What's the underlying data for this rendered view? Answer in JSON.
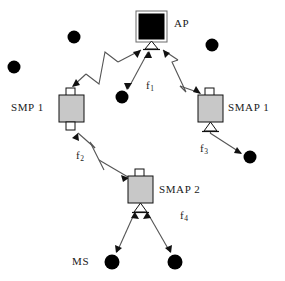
{
  "diagram": {
    "colors": {
      "ap_fill": "#000000",
      "node_fill": "#c8c8c8",
      "node_stroke": "#1a1a1a",
      "stub_fill": "#ffffff",
      "dot_fill": "#000000",
      "line": "#555555",
      "background": "#ffffff"
    },
    "nodes": [
      {
        "id": "ap",
        "label": "AP",
        "type": "access-point",
        "x": 151.5,
        "y": 26.5,
        "box": {
          "x": 137,
          "y": 12,
          "w": 29,
          "h": 29
        },
        "label_x": 174,
        "label_y": 18
      },
      {
        "id": "smp1",
        "label": "SMP  1",
        "type": "smp-relay",
        "x": 71.5,
        "y": 108.5,
        "box": {
          "x": 59,
          "y": 95,
          "w": 25,
          "h": 27
        },
        "label_x": 11,
        "label_y": 102
      },
      {
        "id": "smap1",
        "label": "SMAP  1",
        "type": "smap-relay",
        "x": 210.5,
        "y": 108.5,
        "box": {
          "x": 198,
          "y": 95,
          "w": 25,
          "h": 27
        },
        "label_x": 228,
        "label_y": 102
      },
      {
        "id": "smap2",
        "label": "SMAP  2",
        "type": "smap-relay",
        "x": 140.5,
        "y": 189.5,
        "box": {
          "x": 128,
          "y": 176,
          "w": 25,
          "h": 27
        },
        "label_x": 159,
        "label_y": 184
      }
    ],
    "stations": [
      {
        "id": "ms-a",
        "x": 14,
        "y": 67,
        "r": 6.5
      },
      {
        "id": "ms-b",
        "x": 74,
        "y": 37,
        "r": 6.5
      },
      {
        "id": "ms-c",
        "x": 122,
        "y": 97,
        "r": 6.5
      },
      {
        "id": "ms-d",
        "x": 212,
        "y": 45,
        "r": 6.5
      },
      {
        "id": "ms-e",
        "x": 250,
        "y": 157,
        "r": 6.5
      },
      {
        "id": "ms-f",
        "x": 112,
        "y": 262,
        "r": 7.5
      },
      {
        "id": "ms-g",
        "x": 175,
        "y": 262,
        "r": 7.5
      }
    ],
    "station_group_label": {
      "text": "MS",
      "x": 72,
      "y": 256
    },
    "links": [
      {
        "id": "link-ap-smp1",
        "from": "ap",
        "to": "smp1",
        "kind": "zigzag",
        "arrows": "both"
      },
      {
        "id": "link-ap-smap1",
        "from": "ap",
        "to": "smap1",
        "kind": "zigzag",
        "arrows": "both"
      },
      {
        "id": "link-ms-c-ap",
        "from": "ms-c",
        "to": "ap",
        "kind": "straight",
        "arrows": "both"
      },
      {
        "id": "link-smp1-smap2",
        "from": "smp1",
        "to": "smap2",
        "kind": "zigzag",
        "arrows": "both"
      },
      {
        "id": "link-smap1-ms-e",
        "from": "smap1",
        "to": "ms-e",
        "kind": "straight",
        "arrows": "both"
      },
      {
        "id": "link-smap2-ms-f",
        "from": "smap2",
        "to": "ms-f",
        "kind": "straight",
        "arrows": "both"
      },
      {
        "id": "link-smap2-ms-g",
        "from": "smap2",
        "to": "ms-g",
        "kind": "straight",
        "arrows": "both"
      }
    ],
    "frequency_labels": [
      {
        "id": "f1",
        "base": "f",
        "sub": "1",
        "x": 146,
        "y": 80
      },
      {
        "id": "f2",
        "base": "f",
        "sub": "2",
        "x": 76,
        "y": 150
      },
      {
        "id": "f3",
        "base": "f",
        "sub": "3",
        "x": 200,
        "y": 143
      },
      {
        "id": "f4",
        "base": "f",
        "sub": "4",
        "x": 180,
        "y": 210
      }
    ]
  }
}
